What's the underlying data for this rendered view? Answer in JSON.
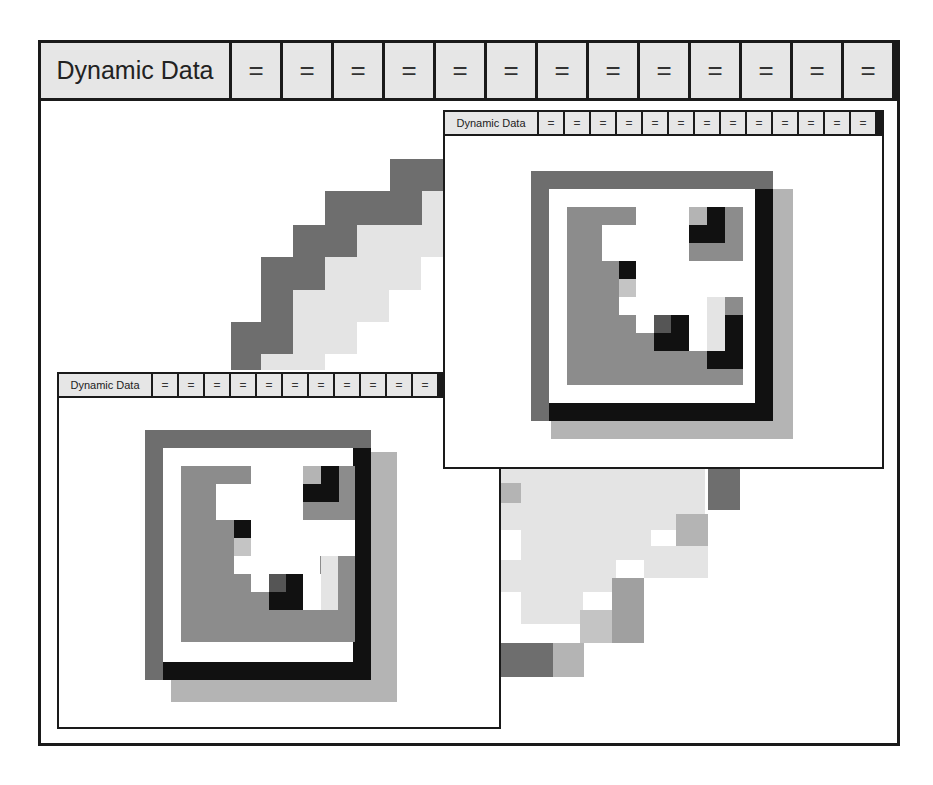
{
  "main_window": {
    "title": "Dynamic Data",
    "buttons": [
      "=",
      "=",
      "=",
      "=",
      "=",
      "=",
      "=",
      "=",
      "=",
      "=",
      "=",
      "=",
      "="
    ],
    "content_icon": "pixel-art-icon-large"
  },
  "window_top_right": {
    "title": "Dynamic Data",
    "buttons": [
      "=",
      "=",
      "=",
      "=",
      "=",
      "=",
      "=",
      "=",
      "=",
      "=",
      "=",
      "=",
      "="
    ],
    "content_icon": "pixel-art-icon"
  },
  "window_bottom_left": {
    "title": "Dynamic Data",
    "buttons": [
      "=",
      "=",
      "=",
      "=",
      "=",
      "=",
      "=",
      "=",
      "=",
      "=",
      "="
    ],
    "content_icon": "pixel-art-icon"
  },
  "colors": {
    "border": "#1a1a1a",
    "titlebar_bg": "#e6e6e6",
    "dark_gray": "#6e6e6e",
    "mid_gray": "#8c8c8c",
    "light_gray": "#b4b4b4",
    "pale_gray": "#e4e4e4",
    "black": "#111111",
    "white": "#ffffff"
  }
}
